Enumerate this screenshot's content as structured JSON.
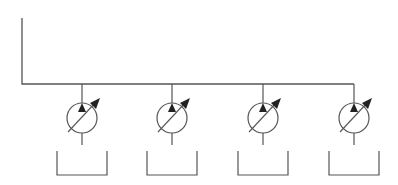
{
  "diagram": {
    "title": "",
    "type": "hydraulic-schematic",
    "stroke_color": "#555555",
    "background": "#ffffff",
    "supply_line": {
      "x_start": 22,
      "y_top": 18,
      "y": 84,
      "x_end": 354
    },
    "pumps": [
      {
        "id": "pump-1",
        "symbol": "variable-displacement-pump",
        "cx": 82,
        "cy": 118,
        "r": 15
      },
      {
        "id": "pump-2",
        "symbol": "variable-displacement-pump",
        "cx": 172,
        "cy": 118,
        "r": 15
      },
      {
        "id": "pump-3",
        "symbol": "variable-displacement-pump",
        "cx": 263,
        "cy": 118,
        "r": 15
      },
      {
        "id": "pump-4",
        "symbol": "variable-displacement-pump",
        "cx": 354,
        "cy": 118,
        "r": 15
      }
    ],
    "tanks": [
      {
        "id": "tank-1",
        "symbol": "reservoir",
        "x": 57,
        "y": 151,
        "w": 50,
        "h": 24
      },
      {
        "id": "tank-2",
        "symbol": "reservoir",
        "x": 147,
        "y": 151,
        "w": 50,
        "h": 24
      },
      {
        "id": "tank-3",
        "symbol": "reservoir",
        "x": 238,
        "y": 151,
        "w": 50,
        "h": 24
      },
      {
        "id": "tank-4",
        "symbol": "reservoir",
        "x": 329,
        "y": 151,
        "w": 50,
        "h": 24
      }
    ]
  }
}
